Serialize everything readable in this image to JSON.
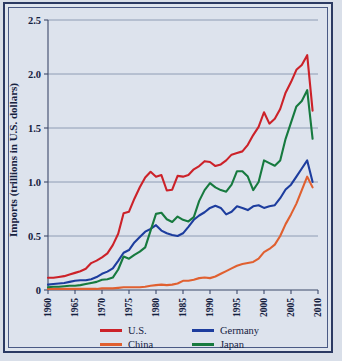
{
  "chart_data": {
    "type": "line",
    "title": "",
    "xlabel": "",
    "ylabel": "Imports (trillions in U.S. dollars)",
    "xlim": [
      1960,
      2010
    ],
    "ylim": [
      0,
      2.5
    ],
    "yticks": [
      "0",
      "0.5",
      "1.0",
      "1.5",
      "2.0",
      "2.5"
    ],
    "ytick_values": [
      0,
      0.5,
      1.0,
      1.5,
      2.0,
      2.5
    ],
    "xticks": [
      "1960",
      "1965",
      "1970",
      "1975",
      "1980",
      "1985",
      "1990",
      "1995",
      "2000",
      "2005",
      "2010"
    ],
    "xtick_values": [
      1960,
      1965,
      1970,
      1975,
      1980,
      1985,
      1990,
      1995,
      2000,
      2005,
      2010
    ],
    "grid": "horizontal",
    "legend_position": "bottom",
    "x": [
      1960,
      1961,
      1962,
      1963,
      1964,
      1965,
      1966,
      1967,
      1968,
      1969,
      1970,
      1971,
      1972,
      1973,
      1974,
      1975,
      1976,
      1977,
      1978,
      1979,
      1980,
      1981,
      1982,
      1983,
      1984,
      1985,
      1986,
      1987,
      1988,
      1989,
      1990,
      1991,
      1992,
      1993,
      1994,
      1995,
      1996,
      1997,
      1998,
      1999,
      2000,
      2001,
      2002,
      2003,
      2004,
      2005,
      2006,
      2007,
      2008,
      2009
    ],
    "series": [
      {
        "name": "U.S.",
        "color": "#cc2229",
        "values": [
          0.15,
          0.15,
          0.16,
          0.17,
          0.19,
          0.21,
          0.25,
          0.26,
          0.31,
          0.33,
          0.4,
          0.45,
          0.55,
          0.69,
          0.94,
          0.95,
          1.12,
          1.26,
          1.38,
          1.45,
          1.39,
          1.41,
          1.22,
          1.23,
          1.4,
          1.39,
          1.41,
          1.48,
          1.52,
          1.58,
          1.57,
          1.52,
          1.54,
          1.59,
          1.66,
          1.68,
          1.7,
          1.78,
          1.9,
          2.0,
          2.18,
          2.04,
          2.1,
          2.22,
          2.42,
          2.55,
          2.7,
          2.76,
          2.88,
          2.2
        ]
      },
      {
        "name": "Germany",
        "color": "#1d3d9e",
        "values": [
          0.1,
          0.11,
          0.12,
          0.13,
          0.15,
          0.17,
          0.18,
          0.18,
          0.2,
          0.24,
          0.3,
          0.34,
          0.4,
          0.54,
          0.69,
          0.74,
          0.88,
          0.98,
          1.08,
          1.13,
          1.2,
          1.1,
          1.05,
          1.02,
          1.0,
          1.05,
          1.17,
          1.3,
          1.38,
          1.44,
          1.52,
          1.56,
          1.52,
          1.4,
          1.45,
          1.55,
          1.52,
          1.48,
          1.55,
          1.57,
          1.52,
          1.55,
          1.57,
          1.7,
          1.86,
          1.95,
          2.1,
          2.25,
          2.4,
          2.0
        ]
      },
      {
        "name": "China",
        "color": "#e06030",
        "values": [
          0.02,
          0.02,
          0.02,
          0.02,
          0.02,
          0.02,
          0.02,
          0.02,
          0.02,
          0.02,
          0.03,
          0.03,
          0.03,
          0.04,
          0.05,
          0.05,
          0.05,
          0.05,
          0.06,
          0.08,
          0.09,
          0.1,
          0.09,
          0.1,
          0.12,
          0.17,
          0.17,
          0.19,
          0.22,
          0.23,
          0.22,
          0.25,
          0.3,
          0.35,
          0.4,
          0.45,
          0.48,
          0.5,
          0.52,
          0.58,
          0.7,
          0.76,
          0.84,
          1.0,
          1.22,
          1.4,
          1.6,
          1.85,
          2.1,
          1.9
        ]
      },
      {
        "name": "Japan",
        "color": "#177a3f",
        "values": [
          0.05,
          0.06,
          0.06,
          0.07,
          0.08,
          0.08,
          0.09,
          0.11,
          0.13,
          0.15,
          0.19,
          0.2,
          0.23,
          0.38,
          0.62,
          0.58,
          0.65,
          0.71,
          0.79,
          1.1,
          1.41,
          1.43,
          1.31,
          1.26,
          1.36,
          1.3,
          1.27,
          1.35,
          1.65,
          1.85,
          1.98,
          1.9,
          1.85,
          1.82,
          1.95,
          2.2,
          2.2,
          2.1,
          1.85,
          2.0,
          2.4,
          2.35,
          2.3,
          2.4,
          2.8,
          3.1,
          3.4,
          3.5,
          3.7,
          2.8
        ]
      }
    ],
    "legend": [
      {
        "name": "U.S.",
        "color": "#cc2229"
      },
      {
        "name": "Germany",
        "color": "#1d3d9e"
      },
      {
        "name": "China",
        "color": "#e06030"
      },
      {
        "name": "Japan",
        "color": "#177a3f"
      }
    ]
  },
  "series_display": {
    "note": "values below are the plotted trillions-USD readings",
    "U.S.": [
      0.15,
      0.15,
      0.16,
      0.17,
      0.19,
      0.21,
      0.23,
      0.26,
      0.33,
      0.36,
      0.4,
      0.45,
      0.55,
      0.69,
      0.94,
      0.96,
      1.12,
      1.26,
      1.38,
      1.45,
      1.39,
      1.41,
      1.22,
      1.23,
      1.4,
      1.39,
      1.41,
      1.48,
      1.52,
      1.58,
      1.57,
      1.52,
      1.54,
      1.59,
      1.66,
      1.68,
      1.7,
      1.78,
      1.9,
      2.0,
      2.18,
      2.04,
      2.1,
      2.22,
      2.42,
      2.55,
      2.7,
      2.76,
      2.88,
      2.2
    ],
    "Germany": [
      0.1,
      0.11,
      0.12,
      0.13,
      0.15,
      0.17,
      0.18,
      0.18,
      0.2,
      0.24,
      0.3,
      0.34,
      0.4,
      0.54,
      0.69,
      0.74,
      0.88,
      0.98,
      1.08,
      1.13,
      1.2,
      1.1,
      1.05,
      1.02,
      1.0,
      1.05,
      1.17,
      1.3,
      1.38,
      1.44,
      1.52,
      1.56,
      1.52,
      1.4,
      1.45,
      1.55,
      1.52,
      1.48,
      1.55,
      1.57,
      1.52,
      1.55,
      1.57,
      1.7,
      1.86,
      1.95,
      2.1,
      2.25,
      2.4,
      2.0
    ]
  },
  "figure": {
    "background": "#dde3ed",
    "frame_color": "#2b3a63",
    "grid_color": "#7b8aa6",
    "text_color": "#15213f"
  }
}
